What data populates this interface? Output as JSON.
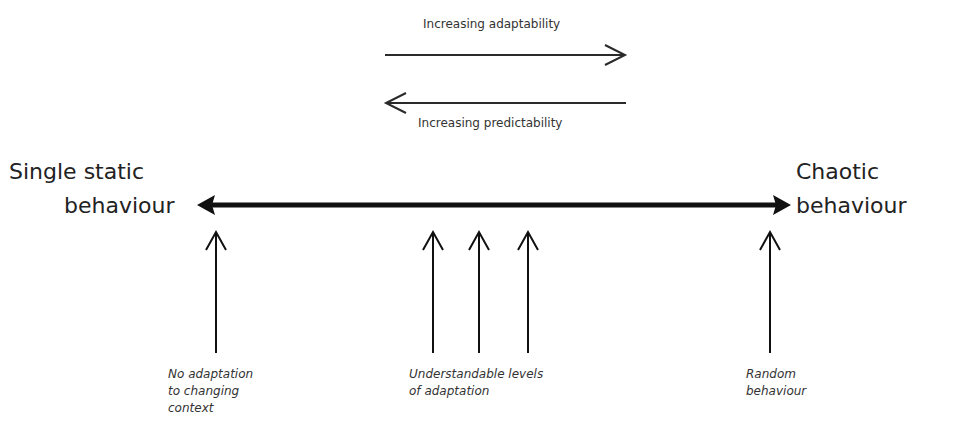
{
  "diagram": {
    "top_arrows": {
      "adaptability": {
        "label": "Increasing adaptability",
        "direction": "right"
      },
      "predictability": {
        "label": "Increasing predictability",
        "direction": "left"
      }
    },
    "spectrum": {
      "left_end": {
        "line1": "Single static",
        "line2": "behaviour"
      },
      "right_end": {
        "line1": "Chaotic",
        "line2": "behaviour"
      }
    },
    "markers": [
      {
        "x": 216,
        "group": "no-adaptation"
      },
      {
        "x": 433,
        "group": "understandable"
      },
      {
        "x": 479,
        "group": "understandable"
      },
      {
        "x": 528,
        "group": "understandable"
      },
      {
        "x": 770,
        "group": "random"
      }
    ],
    "annotations": {
      "no_adaptation": "No adaptation\nto changing\ncontext",
      "understandable": "Understandable levels\nof adaptation",
      "random": "Random\nbehaviour"
    },
    "colors": {
      "line": "#111111",
      "text": "#222222",
      "background": "#ffffff"
    }
  }
}
